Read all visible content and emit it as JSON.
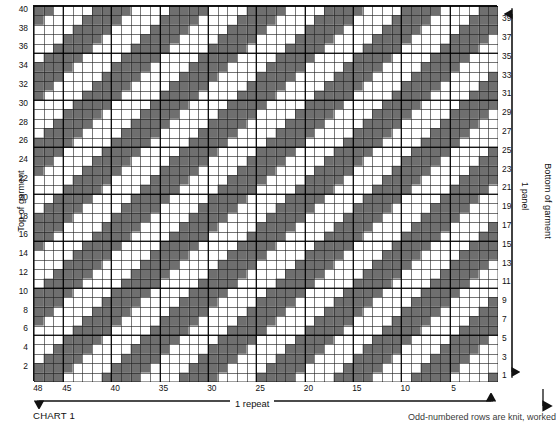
{
  "chart_data": {
    "type": "heatmap",
    "title": "CHART 1",
    "xlabel": "1 repeat",
    "ylabel": "1 panel",
    "columns": 48,
    "rows": 40,
    "grid": true,
    "heavy_gridline_every": 5,
    "x_direction": "right-to-left",
    "y_direction": "bottom-to-top",
    "xlim": [
      1,
      48
    ],
    "ylim": [
      1,
      40
    ],
    "cell_states": [
      "knit",
      "purl"
    ],
    "colors": {
      "filled": "#6f6f6f",
      "empty": "#ffffff",
      "gridline": "#222222",
      "heavy_gridline": "#000000"
    },
    "pattern": {
      "description": "Diagonal bands of shaded cells running from lower-left to upper-right, with checkerboard transition rows between solid diagonal bands.",
      "diagonal_period": 8,
      "diagonal_slope": 1,
      "band_width": 3
    },
    "x_tick_labels": [
      "48",
      "45",
      "40",
      "35",
      "30",
      "25",
      "20",
      "15",
      "10",
      "5"
    ],
    "x_tick_columns": [
      48,
      45,
      40,
      35,
      30,
      25,
      20,
      15,
      10,
      5
    ],
    "y_tick_labels_left": [
      "40",
      "38",
      "36",
      "34",
      "32",
      "30",
      "28",
      "26",
      "24",
      "22",
      "20",
      "18",
      "16",
      "14",
      "12",
      "10",
      "8",
      "6",
      "4",
      "2"
    ],
    "y_tick_labels_right": [
      "39",
      "37",
      "35",
      "33",
      "31",
      "29",
      "27",
      "25",
      "23",
      "21",
      "19",
      "17",
      "15",
      "13",
      "11",
      "9",
      "7",
      "5",
      "3",
      "1"
    ]
  },
  "labels": {
    "top_of_garment": "Top of garment",
    "bottom_of_garment": "Bottom of garment",
    "panel": "1 panel",
    "repeat": "1 repeat",
    "chart_title": "CHART 1",
    "note": "Odd-numbered rows are knit, worked"
  }
}
